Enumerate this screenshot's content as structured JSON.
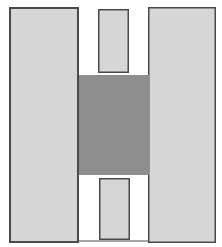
{
  "diagram": {
    "width": 222,
    "height": 247,
    "background": "#ffffff",
    "shapes": [
      {
        "id": "left-block",
        "x": 9,
        "y": 7,
        "w": 70,
        "h": 236,
        "fill": "#d6d6d6",
        "stroke": "#4a4a4a",
        "stroke_width": 2
      },
      {
        "id": "right-block",
        "x": 148,
        "y": 7,
        "w": 68,
        "h": 236,
        "fill": "#d6d6d6",
        "stroke": "#4a4a4a",
        "stroke_width": 1.5
      },
      {
        "id": "top-slot",
        "x": 98,
        "y": 9,
        "w": 31,
        "h": 64,
        "fill": "#d6d6d6",
        "stroke": "#4a4a4a",
        "stroke_width": 1.5
      },
      {
        "id": "center-block",
        "x": 79,
        "y": 75,
        "w": 70,
        "h": 100,
        "fill": "#8e8e8e",
        "stroke": "#8e8e8e",
        "stroke_width": 0
      },
      {
        "id": "bottom-slot",
        "x": 99,
        "y": 178,
        "w": 31,
        "h": 62,
        "fill": "#d6d6d6",
        "stroke": "#4a4a4a",
        "stroke_width": 1.5
      }
    ],
    "lines": [
      {
        "id": "bottom-baseline",
        "x1": 78,
        "y1": 241,
        "x2": 149,
        "y2": 241,
        "stroke": "#4a4a4a",
        "stroke_width": 1
      }
    ]
  }
}
